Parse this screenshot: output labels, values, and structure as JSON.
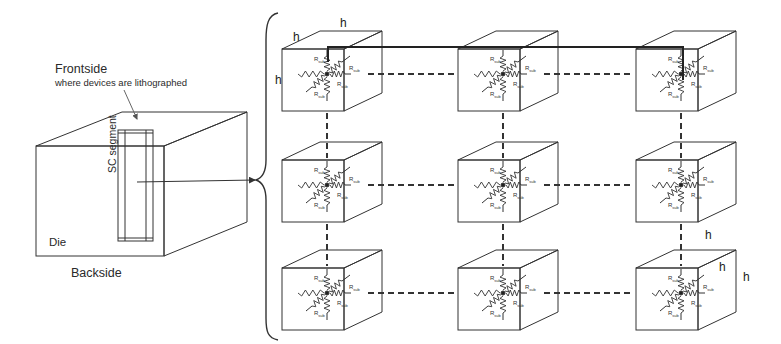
{
  "labels": {
    "frontside": "Frontside",
    "frontside_sub": "where devices are lithographed",
    "sc_segment": "SC segment",
    "die": "Die",
    "backside": "Backside",
    "dimension": "h",
    "resistor": "Rsub"
  },
  "colors": {
    "stroke": "#333333",
    "background": "#ffffff"
  },
  "grid": {
    "rows": 3,
    "cols": 3,
    "cube_front_size": 62,
    "cube_depth_dx": 38,
    "cube_depth_dy": -18,
    "col_x": [
      282,
      458,
      636
    ],
    "row_y": [
      49,
      160,
      268
    ]
  },
  "die": {
    "front": [
      36,
      146,
      164,
      256
    ],
    "depth_dx": 83,
    "depth_dy": -34,
    "sc_segment": [
      118,
      130,
      153,
      241
    ]
  }
}
